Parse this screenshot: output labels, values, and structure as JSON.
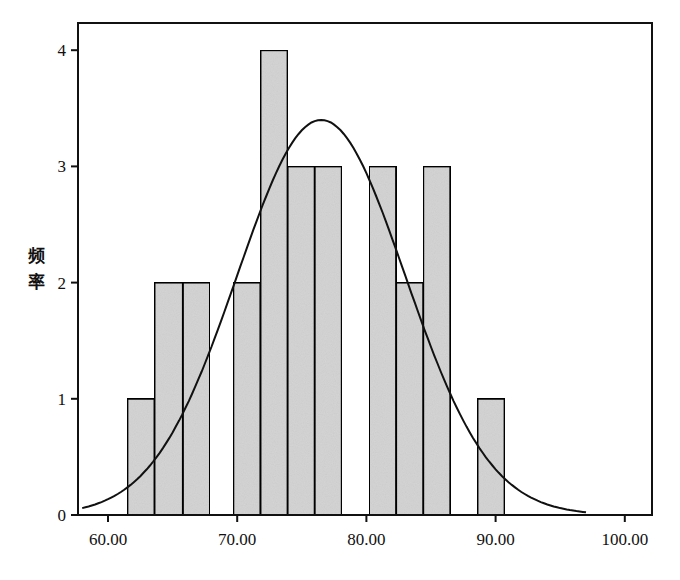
{
  "chart_data": {
    "type": "bar",
    "subtype": "histogram_with_normal_curve",
    "title": "",
    "xlabel": "",
    "ylabel": "频率",
    "xlim": [
      57.6,
      102.1
    ],
    "ylim": [
      0,
      4.2
    ],
    "xticks": [
      60,
      70,
      80,
      90,
      100
    ],
    "xtick_labels": [
      "60.00",
      "70.00",
      "80.00",
      "90.00",
      "100.00"
    ],
    "yticks": [
      0,
      1,
      2,
      3,
      4
    ],
    "ytick_labels": [
      "0",
      "1",
      "2",
      "3",
      "4"
    ],
    "bin_width": 2.1,
    "bins": [
      {
        "start": 61.5,
        "end": 63.6,
        "count": 1
      },
      {
        "start": 63.6,
        "end": 65.8,
        "count": 2
      },
      {
        "start": 65.8,
        "end": 67.9,
        "count": 2
      },
      {
        "start": 69.7,
        "end": 71.8,
        "count": 2
      },
      {
        "start": 71.8,
        "end": 73.9,
        "count": 4
      },
      {
        "start": 73.9,
        "end": 76.0,
        "count": 3
      },
      {
        "start": 76.0,
        "end": 78.1,
        "count": 3
      },
      {
        "start": 80.2,
        "end": 82.3,
        "count": 3
      },
      {
        "start": 82.3,
        "end": 84.4,
        "count": 2
      },
      {
        "start": 84.4,
        "end": 86.5,
        "count": 3
      },
      {
        "start": 88.6,
        "end": 90.7,
        "count": 1
      }
    ],
    "categories": [
      "61.5-63.6",
      "63.6-65.8",
      "65.8-67.9",
      "69.7-71.8",
      "71.8-73.9",
      "73.9-76.0",
      "76.0-78.1",
      "80.2-82.3",
      "82.3-84.4",
      "84.4-86.5",
      "88.6-90.7"
    ],
    "values": [
      1,
      2,
      2,
      2,
      4,
      3,
      3,
      3,
      2,
      3,
      1
    ],
    "normal_curve": {
      "mean": 76.5,
      "peak": 3.4,
      "sd": 6.5,
      "x_start": 58.0,
      "x_end": 97.0
    },
    "grid": false,
    "legend": null,
    "colors": {
      "bar_fill": "#d6d6d6",
      "bar_edge": "#111111",
      "curve": "#111111",
      "frame": "#111111"
    }
  }
}
